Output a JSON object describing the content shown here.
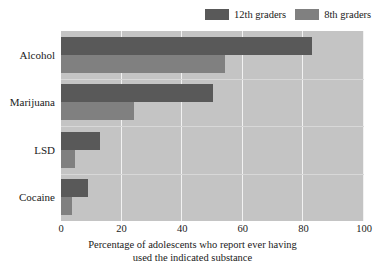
{
  "chart_data": {
    "type": "bar",
    "orientation": "horizontal",
    "title": "",
    "subtitle": "",
    "xlabel_line1": "Percentage of adolescents who report ever having",
    "xlabel_line2": "used the indicated substance",
    "ylabel": "",
    "categories": [
      "Alcohol",
      "Marijuana",
      "LSD",
      "Cocaine"
    ],
    "series": [
      {
        "name": "12th graders",
        "color": "#595959",
        "values": [
          83,
          50,
          13,
          9
        ]
      },
      {
        "name": "8th graders",
        "color": "#808080",
        "values": [
          54,
          24,
          4.5,
          3.5
        ]
      }
    ],
    "xlim": [
      0,
      100
    ],
    "xticks": [
      0,
      20,
      40,
      60,
      80,
      100
    ],
    "xtick_labels": [
      "0",
      "20",
      "40",
      "60",
      "80",
      "100"
    ],
    "grid": "vertical-white",
    "legend_position": "top-right",
    "plot_background": "#c4c4c4",
    "gridline_color": "#f2f2f2"
  },
  "legend": {
    "entries": [
      {
        "label": "12th graders",
        "color": "#595959"
      },
      {
        "label": "8th graders",
        "color": "#808080"
      }
    ]
  },
  "axis": {
    "x": {
      "ticks": [
        "0",
        "20",
        "40",
        "60",
        "80",
        "100"
      ]
    },
    "y": {
      "categories": [
        "Alcohol",
        "Marijuana",
        "LSD",
        "Cocaine"
      ]
    }
  },
  "caption": {
    "line1": "Percentage of adolescents who report ever having",
    "line2": "used the indicated substance"
  }
}
